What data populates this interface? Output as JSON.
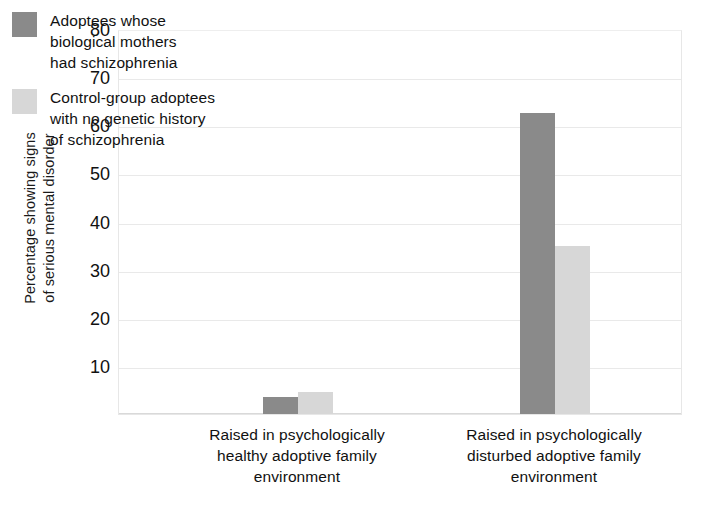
{
  "chart_data": {
    "type": "bar",
    "title": "",
    "xlabel": "",
    "ylabel": "Percentage showing signs of serious mental disorder",
    "ylabel_lines": [
      "Percentage showing signs",
      "of serious mental disorder"
    ],
    "ylim": [
      0,
      80
    ],
    "ytick_values": [
      80,
      70,
      60,
      50,
      40,
      30,
      20,
      10
    ],
    "ytick_labels": [
      "80",
      "70",
      "60",
      "50",
      "40",
      "30",
      "20",
      "10"
    ],
    "grid": true,
    "legend_position": "upper-left-inside",
    "categories": [
      "Raised in psychologically healthy adoptive family environment",
      "Raised in psychologically disturbed adoptive family environment"
    ],
    "category_lines": [
      [
        "Raised in psychologically",
        "healthy adoptive family",
        "environment"
      ],
      [
        "Raised in psychologically",
        "disturbed adoptive family",
        "environment"
      ]
    ],
    "series": [
      {
        "name": "Adoptees whose biological mothers had schizophrenia",
        "name_lines": [
          "Adoptees whose",
          "biological mothers",
          "had schizophrenia"
        ],
        "color": "#8a8a8a",
        "values": [
          3.5,
          62.5
        ]
      },
      {
        "name": "Control-group adoptees with no genetic history of schizophrenia",
        "name_lines": [
          "Control-group adoptees",
          "with no genetic history",
          "of schizophrenia"
        ],
        "color": "#d7d7d7",
        "values": [
          4.5,
          35
        ]
      }
    ]
  },
  "colors": {
    "series_dark": "#8a8a8a",
    "series_light": "#d7d7d7",
    "gridline": "#e9e9e9",
    "axis_text": "#111111",
    "background": "#ffffff"
  }
}
